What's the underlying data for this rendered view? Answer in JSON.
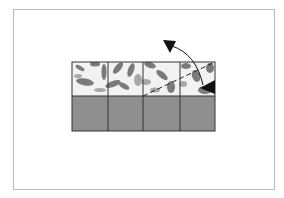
{
  "diagram": {
    "type": "folding-instruction",
    "grid": {
      "columns": 4,
      "rows": 2
    },
    "colors": {
      "frame": "#b8b8b8",
      "grid_line": "#333333",
      "bottom_row": "#8f8f8f",
      "pattern_light": "#f2f2f2",
      "pattern_dark": "#7a7a7a",
      "pattern_mid": "#a8a8a8",
      "arrow": "#111111"
    },
    "fold_line": {
      "style": "dashed",
      "from": [
        143,
        96
      ],
      "to": [
        215,
        62
      ]
    },
    "arrow": {
      "style": "curved",
      "from": [
        203,
        89
      ],
      "to": [
        163,
        40
      ],
      "double_headed": true
    }
  }
}
